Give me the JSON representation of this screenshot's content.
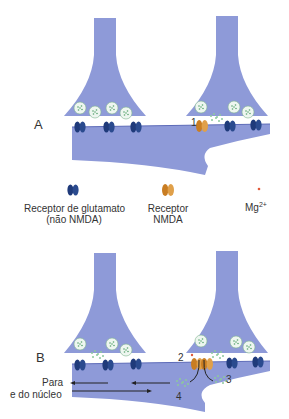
{
  "panels": {
    "A": {
      "label": "A",
      "step1": "1"
    },
    "B": {
      "label": "B",
      "step2": "2",
      "step3": "3",
      "step4": "4",
      "arrow_text_line1": "Para",
      "arrow_text_line2": "e do núcleo"
    }
  },
  "legend": {
    "glutamate_receptor_line1": "Receptor de glutamato",
    "glutamate_receptor_line2": "(não NMDA)",
    "nmda_receptor_line1": "Receptor",
    "nmda_receptor_line2": "NMDA",
    "mg": "Mg",
    "mg_sup": "2+"
  },
  "colors": {
    "neuron": "#8e9ad8",
    "glutamate_receptor": "#1f3a7a",
    "nmda_receptor": "#d8902f",
    "vesicle": "#e6f4ea",
    "mg_ion": "#e25a3a"
  }
}
